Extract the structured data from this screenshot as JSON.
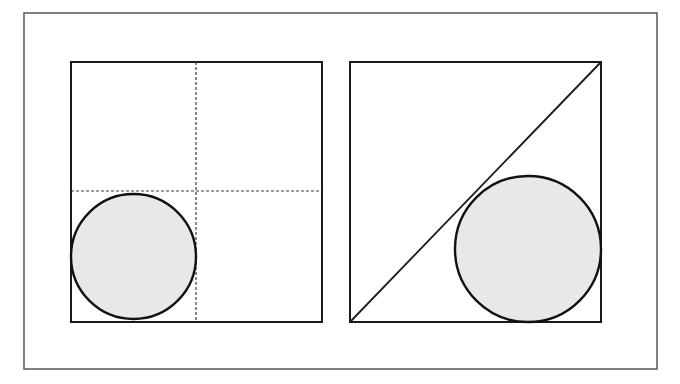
{
  "canvas": {
    "width": 680,
    "height": 384,
    "background_color": "#ffffff"
  },
  "style": {
    "outer_frame_color": "#4a4a4a",
    "outer_frame_width": 1.4,
    "square_stroke_color": "#1a1a1a",
    "square_stroke_width": 2.0,
    "circle_stroke_color": "#111111",
    "circle_stroke_width": 2.4,
    "circle_fill_color": "#e8e8e8",
    "dashed_line_color": "#3c3c3c",
    "dashed_line_width": 1.2,
    "dash_pattern": "3,2",
    "diagonal_stroke_color": "#1a1a1a",
    "diagonal_stroke_width": 1.8
  },
  "outer_frame": {
    "label": "outer-border",
    "x": 24,
    "y": 13,
    "width": 633,
    "height": 356
  },
  "panels": [
    {
      "id": "left-panel",
      "label": "Circle inscribed in lower-left quadrant",
      "square": {
        "x": 71,
        "y": 62,
        "width": 251,
        "height": 260
      },
      "dashed_lines": [
        {
          "id": "vertical-midline",
          "orientation": "vertical",
          "x1": 196,
          "y1": 62,
          "x2": 196,
          "y2": 322
        },
        {
          "id": "horizontal-midline",
          "orientation": "horizontal",
          "x1": 71,
          "y1": 191,
          "x2": 322,
          "y2": 191
        }
      ],
      "circle": {
        "id": "left-circle",
        "cx": 133.5,
        "cy": 256.5,
        "r": 62.5,
        "tangencies": [
          "left-edge",
          "bottom-edge",
          "vertical-midline",
          "horizontal-midline"
        ]
      }
    },
    {
      "id": "right-panel",
      "label": "Circle tangent to diagonal and two sides",
      "square": {
        "x": 350,
        "y": 62,
        "width": 251,
        "height": 260
      },
      "diagonal": {
        "id": "corner-diagonal",
        "x1": 350,
        "y1": 322,
        "x2": 601,
        "y2": 62
      },
      "circle": {
        "id": "right-circle",
        "cx": 528,
        "cy": 249,
        "r": 73,
        "tangencies": [
          "diagonal",
          "right-edge",
          "bottom-edge"
        ]
      }
    }
  ]
}
